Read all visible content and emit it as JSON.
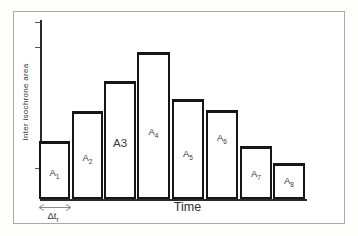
{
  "figure": {
    "interval_label": {
      "base": "Δt",
      "sub": "r"
    }
  },
  "chart_data": {
    "type": "bar",
    "title": "",
    "xlabel": "Time",
    "ylabel": "Inter isochrone area",
    "categories": [
      "A1",
      "A2",
      "A3",
      "A4",
      "A5",
      "A6",
      "A7",
      "A8"
    ],
    "values_relative_height": [
      58,
      88,
      118,
      147,
      100,
      89,
      53,
      36
    ],
    "ylim": null,
    "grid": false,
    "legend": false,
    "annotation": "double-headed arrow labeled Δt r marking the time-interval width of the first bar",
    "layout": {
      "baseline_y_px": 199,
      "axis_x_px": 40,
      "y_ticks_px": [
        22,
        47,
        168
      ],
      "bars": [
        {
          "name": "A1",
          "label_base": "A",
          "label_sub": "1",
          "sub_style": "sub",
          "x": 39,
          "w": 31,
          "h": 58,
          "label_y": 172
        },
        {
          "name": "A2",
          "label_base": "A",
          "label_sub": "2",
          "sub_style": "sub",
          "x": 72,
          "w": 31,
          "h": 88,
          "label_y": 157
        },
        {
          "name": "A3",
          "label_base": "A",
          "label_sub": "3",
          "sub_style": "inline",
          "x": 104,
          "w": 32,
          "h": 118,
          "label_y": 142
        },
        {
          "name": "A4",
          "label_base": "A",
          "label_sub": "4",
          "sub_style": "sub",
          "x": 137,
          "w": 33,
          "h": 147,
          "label_y": 131
        },
        {
          "name": "A5",
          "label_base": "A",
          "label_sub": "5",
          "sub_style": "sub",
          "x": 172,
          "w": 32,
          "h": 100,
          "label_y": 153
        },
        {
          "name": "A6",
          "label_base": "A",
          "label_sub": "6",
          "sub_style": "sub",
          "x": 206,
          "w": 32,
          "h": 89,
          "label_y": 137
        },
        {
          "name": "A7",
          "label_base": "A",
          "label_sub": "7",
          "sub_style": "sub",
          "x": 240,
          "w": 32,
          "h": 53,
          "label_y": 173
        },
        {
          "name": "A8",
          "label_base": "A",
          "label_sub": "8",
          "sub_style": "sub",
          "x": 273,
          "w": 32,
          "h": 36,
          "label_y": 180
        }
      ]
    },
    "colors": {
      "bar_fill": "#ffffff",
      "bar_border": "#161616",
      "axis": "#2a2a2a",
      "frame": "#a9aaa8",
      "arrow": "#8a8a8a",
      "text": "#333333"
    }
  }
}
